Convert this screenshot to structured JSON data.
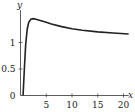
{
  "chart_data": {
    "type": "line",
    "title": "",
    "xlabel": "x",
    "ylabel": "y",
    "xlim": [
      0,
      21
    ],
    "ylim": [
      0,
      1.55
    ],
    "grid": false,
    "legend": null,
    "x_ticks": [
      5,
      10,
      15,
      20
    ],
    "x_tick_labels": [
      "5",
      "10",
      "15",
      "20"
    ],
    "y_ticks": [
      0,
      0.5,
      1
    ],
    "y_tick_labels": [
      "0",
      "0.5",
      "1"
    ],
    "series": [
      {
        "name": "curve",
        "color": "#222222",
        "x": [
          0.5,
          0.8,
          1.0,
          1.3,
          1.6,
          2.0,
          2.5,
          3,
          4,
          5,
          6,
          8,
          10,
          12,
          15,
          18,
          21
        ],
        "y": [
          0.0,
          0.6,
          0.95,
          1.25,
          1.38,
          1.44,
          1.45,
          1.44,
          1.41,
          1.38,
          1.35,
          1.3,
          1.26,
          1.23,
          1.2,
          1.18,
          1.16
        ]
      }
    ]
  }
}
